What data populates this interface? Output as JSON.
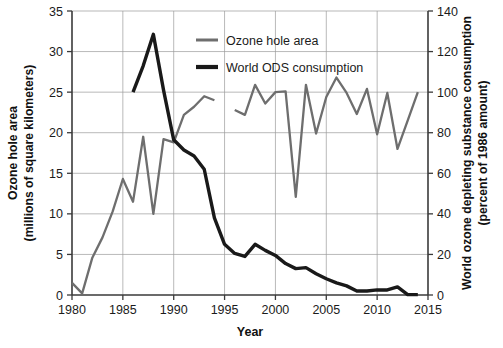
{
  "chart_data": {
    "type": "line",
    "title": "",
    "xlabel": "Year",
    "ylabel": "Ozone hole area\n(millions of square kilometers)",
    "ylabel_line1": "Ozone hole area",
    "ylabel_line2": "(millions of square kilometers)",
    "y2label_line1": "World ozone depleting substance consumption",
    "y2label_line2": "(percent of 1986 amount)",
    "xlim": [
      1980,
      2015
    ],
    "ylim": [
      0,
      35
    ],
    "y2lim": [
      0,
      140
    ],
    "xticks": [
      "1980",
      "1985",
      "1990",
      "1995",
      "2000",
      "2005",
      "2010",
      "2015"
    ],
    "xtick_values": [
      1980,
      1985,
      1990,
      1995,
      2000,
      2005,
      2010,
      2015
    ],
    "yticks": [
      "0",
      "5",
      "10",
      "15",
      "20",
      "25",
      "30",
      "35"
    ],
    "ytick_values": [
      0,
      5,
      10,
      15,
      20,
      25,
      30,
      35
    ],
    "y2ticks": [
      "0",
      "20",
      "40",
      "60",
      "80",
      "100",
      "120",
      "140"
    ],
    "y2tick_values": [
      0,
      20,
      40,
      60,
      80,
      100,
      120,
      140
    ],
    "grid": true,
    "grid_axis": "y",
    "legend_position": "top-center",
    "colors": {
      "ozone_hole_area": "#6e6e6e",
      "world_ods_consumption": "#191919",
      "grid": "#9a9a9a",
      "axis": "#3a3a3a",
      "text": "#1b1b1b",
      "background": "#ffffff"
    },
    "series": [
      {
        "name": "Ozone hole area",
        "axis": "left",
        "units": "millions of square kilometers",
        "color": "#6e6e6e",
        "stroke_width": 2.3,
        "segments": [
          {
            "x": [
              1980,
              1981,
              1982,
              1983,
              1984,
              1985,
              1986,
              1987,
              1988,
              1989,
              1990,
              1991,
              1992,
              1993,
              1994
            ],
            "y": [
              1.5,
              0.2,
              4.6,
              7.1,
              10.3,
              14.3,
              11.5,
              19.5,
              10.0,
              19.2,
              18.8,
              22.2,
              23.2,
              24.5,
              24.0
            ]
          },
          {
            "x": [
              1996,
              1997,
              1998,
              1999,
              2000,
              2001,
              2002,
              2003,
              2004,
              2005,
              2006,
              2007,
              2008,
              2009,
              2010,
              2011,
              2012,
              2013,
              2014
            ],
            "y": [
              22.8,
              22.2,
              25.9,
              23.6,
              25.0,
              25.1,
              12.1,
              25.9,
              19.9,
              24.4,
              26.8,
              24.9,
              22.3,
              25.4,
              19.8,
              24.9,
              18.0,
              21.5,
              25.0
            ]
          }
        ]
      },
      {
        "name": "World ODS consumption",
        "axis": "right",
        "units": "percent of 1986 amount",
        "color": "#191919",
        "stroke_width": 3.4,
        "segments": [
          {
            "x": [
              1986,
              1987,
              1988,
              1989,
              1990,
              1991,
              1992,
              1993,
              1994,
              1995,
              1996,
              1997,
              1998,
              1999,
              2000,
              2001,
              2002,
              2003,
              2004,
              2005,
              2006,
              2007,
              2008,
              2009,
              2010,
              2011,
              2012,
              2013,
              2014
            ],
            "y": [
              100.0,
              113.0,
              128.5,
              101.0,
              76.5,
              71.5,
              68.5,
              62.0,
              38.0,
              25.0,
              20.5,
              19.0,
              25.0,
              22.0,
              19.5,
              15.5,
              13.0,
              13.5,
              10.5,
              8.0,
              6.0,
              4.5,
              2.0,
              2.0,
              2.5,
              2.5,
              4.0,
              0.2,
              0.2
            ]
          }
        ]
      }
    ],
    "annotations": [
      {
        "note": "Gray ozone-hole series has a data gap between 1994 and 1996"
      }
    ]
  },
  "legend": {
    "items": [
      {
        "label": "Ozone hole area",
        "marker": "line-swatch-gray"
      },
      {
        "label": "World ODS consumption",
        "marker": "line-swatch-black"
      }
    ]
  }
}
